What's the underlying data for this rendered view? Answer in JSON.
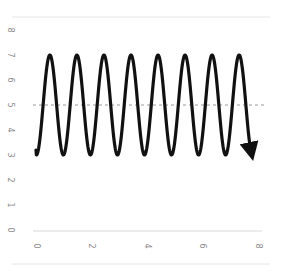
{
  "chart_data": {
    "type": "line",
    "title": "",
    "xlabel": "",
    "ylabel": "",
    "xlim": [
      0,
      8
    ],
    "ylim": [
      0,
      8
    ],
    "x_ticks": [
      "0",
      "2",
      "4",
      "6",
      "8"
    ],
    "y_ticks": [
      "0",
      "1",
      "2",
      "3",
      "4",
      "5",
      "6",
      "7",
      "8"
    ],
    "grid": false,
    "legend": null,
    "series": [
      {
        "name": "oscillation",
        "description": "sinusoid oscillating between 3 and 7 around midline 5, ending in an arrowhead",
        "color": "#111111",
        "midline": 5,
        "amplitude": 2,
        "min": 3,
        "max": 7,
        "cycles": 8,
        "x_start": 0,
        "x_end": 7.75,
        "y_start": 3.2,
        "peaks_x": [
          0.5,
          1.48,
          2.42,
          3.36,
          4.33,
          5.26,
          6.2,
          7.32
        ],
        "arrow_at_end": true
      }
    ],
    "annotations": [
      {
        "type": "hline",
        "y": 5,
        "style": "dashed",
        "color": "#9a9a9a"
      }
    ]
  }
}
